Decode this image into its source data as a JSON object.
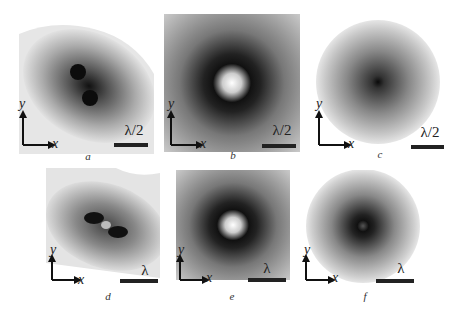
{
  "figure": {
    "panels": [
      {
        "id": "a",
        "label": "a",
        "scale": "λ/2",
        "axis_x": "x",
        "axis_y": "y",
        "pattern": "two dark spots, diagonal elongated"
      },
      {
        "id": "b",
        "label": "b",
        "scale": "λ/2",
        "axis_x": "x",
        "axis_y": "y",
        "pattern": "bright center, dark ring"
      },
      {
        "id": "c",
        "label": "c",
        "scale": "λ/2",
        "axis_x": "x",
        "axis_y": "y",
        "pattern": "single dark center, circular"
      },
      {
        "id": "d",
        "label": "d",
        "scale": "λ",
        "axis_x": "x",
        "axis_y": "y",
        "pattern": "two dark lobes, bright gap, elongated"
      },
      {
        "id": "e",
        "label": "e",
        "scale": "λ",
        "axis_x": "x",
        "axis_y": "y",
        "pattern": "bright center, dark ring"
      },
      {
        "id": "f",
        "label": "f",
        "scale": "λ",
        "axis_x": "x",
        "axis_y": "y",
        "pattern": "dark ring around center, circular"
      }
    ]
  }
}
